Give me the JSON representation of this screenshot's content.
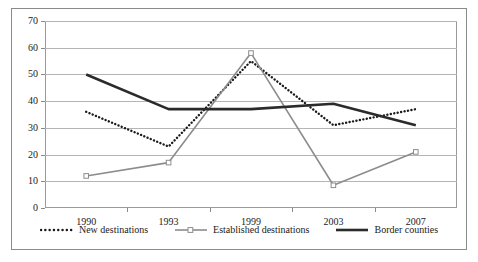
{
  "chart_data": {
    "type": "line",
    "title": "",
    "xlabel": "",
    "ylabel": "",
    "categories": [
      "1990",
      "1993",
      "1999",
      "2003",
      "2007"
    ],
    "ylim": [
      0,
      70
    ],
    "yticks": [
      0,
      10,
      20,
      30,
      40,
      50,
      60,
      70
    ],
    "ytick_labels": [
      "0",
      "10",
      "20",
      "30",
      "40",
      "50",
      "60",
      "70"
    ],
    "grid": true,
    "legend_position": "bottom",
    "series": [
      {
        "name": "New destinations",
        "values": [
          36,
          23,
          55,
          31,
          37
        ],
        "style": "dotted",
        "color": "#1a1a1a",
        "marker": "none"
      },
      {
        "name": "Established destinations",
        "values": [
          12,
          17,
          58,
          8.5,
          21
        ],
        "style": "solid",
        "color": "#8c8c8c",
        "marker": "square"
      },
      {
        "name": "Border counties",
        "values": [
          50,
          37,
          37,
          39,
          31
        ],
        "style": "solid",
        "color": "#2b2b2b",
        "marker": "none"
      }
    ]
  },
  "legend": {
    "items": [
      {
        "label": "New destinations"
      },
      {
        "label": "Established destinations"
      },
      {
        "label": "Border counties"
      }
    ]
  }
}
